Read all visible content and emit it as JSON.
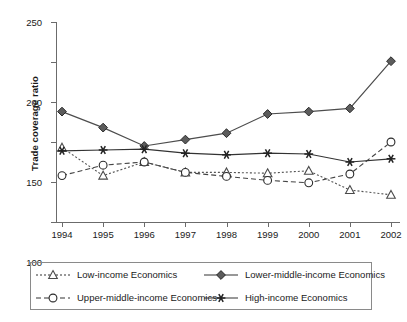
{
  "chart_data": {
    "type": "line",
    "title": "",
    "xlabel": "",
    "ylabel": "Trade coverage ratio",
    "categories": [
      "1994",
      "1995",
      "1996",
      "1997",
      "1998",
      "1999",
      "2000",
      "2001",
      "2002"
    ],
    "x": [
      1994,
      1995,
      1996,
      1997,
      1998,
      1999,
      2000,
      2001,
      2002
    ],
    "ylim": [
      0,
      250
    ],
    "yticks": [
      0,
      50,
      100,
      150,
      200,
      250
    ],
    "grid": false,
    "legend_position": "bottom",
    "series": [
      {
        "name": "Low-income Economics",
        "marker": "triangle-open",
        "line": "dotted",
        "color": "#555555",
        "values": [
          93,
          58,
          75,
          62,
          62,
          61,
          64,
          40,
          34
        ]
      },
      {
        "name": "Lower-middle-income Economics",
        "marker": "diamond-filled",
        "line": "solid",
        "color": "#4d4d4d",
        "values": [
          138,
          118,
          95,
          103,
          111,
          135,
          138,
          142,
          201
        ]
      },
      {
        "name": "Upper-middle-income Economics",
        "marker": "circle-open",
        "line": "dashed",
        "color": "#444444",
        "values": [
          58,
          71,
          75,
          62,
          57,
          52,
          49,
          60,
          100
        ]
      },
      {
        "name": "High-income Economics",
        "marker": "asterisk",
        "line": "solid",
        "color": "#333333",
        "values": [
          89,
          90,
          91,
          86,
          84,
          86,
          85,
          75,
          79
        ]
      }
    ]
  },
  "axis": {
    "y_title": "Trade coverage ratio",
    "y_tick_labels": [
      "0",
      "50",
      "100",
      "150",
      "200",
      "250"
    ],
    "x_tick_labels": [
      "1994",
      "1995",
      "1996",
      "1997",
      "1998",
      "1999",
      "2000",
      "2001",
      "2002"
    ]
  },
  "legend": {
    "items": [
      {
        "label": "Low-income Economics",
        "marker": "triangle-open",
        "line": "dotted"
      },
      {
        "label": "Lower-middle-income Economics",
        "marker": "diamond-filled",
        "line": "solid"
      },
      {
        "label": "Upper-middle-income Economics",
        "marker": "circle-open",
        "line": "dashed"
      },
      {
        "label": "High-income Economics",
        "marker": "asterisk",
        "line": "solid"
      }
    ]
  },
  "colors": {
    "axis": "#6b6b6b",
    "text": "#1a1a1a",
    "legend_border": "#8a8a8a",
    "background": "#ffffff"
  }
}
